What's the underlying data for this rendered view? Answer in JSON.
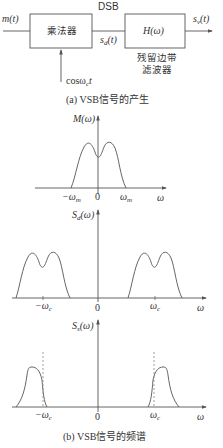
{
  "block_diagram": {
    "input_label": "m(t)",
    "multiplier_label": "乘法器",
    "carrier_label": "cosω",
    "carrier_sub": "c",
    "carrier_suffix": "t",
    "dsb_label": "DSB",
    "sd_label": "s",
    "sd_sub": "d",
    "sd_suffix": "(t)",
    "filter_label": "H(ω)",
    "filter_caption_line1": "残留边带",
    "filter_caption_line2": "滤波器",
    "output_label": "s",
    "output_sub": "v",
    "output_suffix": "(t)",
    "caption": "(a) VSB信号的产生"
  },
  "spectra": {
    "m_plot": {
      "ylabel": "M(ω)",
      "ticks": [
        "−ω",
        "0",
        "ω"
      ],
      "tick_sub": "m",
      "xlabel": "ω"
    },
    "sd_plot": {
      "ylabel": "S",
      "ylabel_sub": "d",
      "ylabel_suffix": "(ω)",
      "ticks": [
        "−ω",
        "0",
        "ω"
      ],
      "tick_sub": "c",
      "xlabel": "ω"
    },
    "ss_plot": {
      "ylabel": "S",
      "ylabel_sub": "s",
      "ylabel_suffix": "(ω)",
      "ticks": [
        "−ω",
        "0",
        "ω"
      ],
      "tick_sub": "c",
      "xlabel": "ω"
    },
    "caption": "(b) VSB信号的频谱"
  },
  "colors": {
    "line": "#555555",
    "text": "#333333",
    "dashed": "#888888"
  }
}
